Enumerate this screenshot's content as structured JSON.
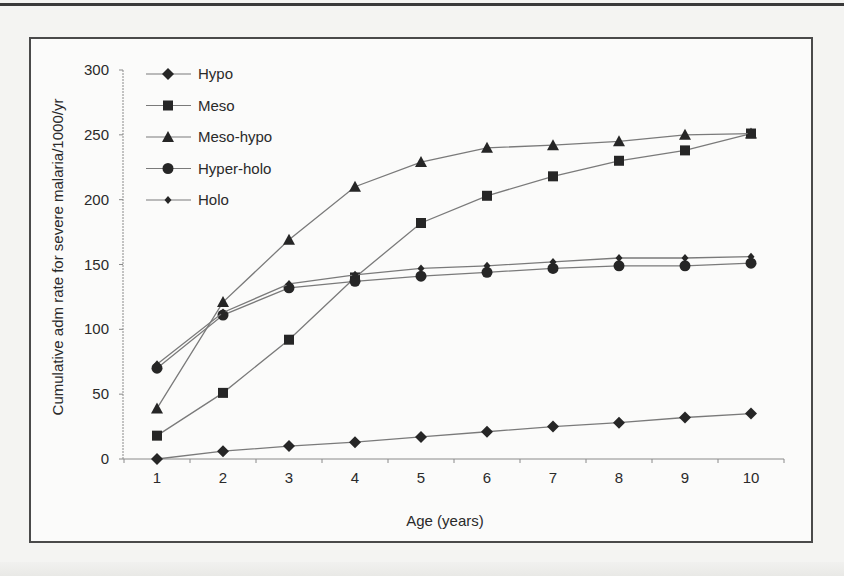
{
  "chart_data": {
    "type": "line",
    "title": "",
    "xlabel": "Age (years)",
    "ylabel": "Cumulative adm rate for severe malaria/1000/yr",
    "x": [
      1,
      2,
      3,
      4,
      5,
      6,
      7,
      8,
      9,
      10
    ],
    "xticks": [
      "1",
      "2",
      "3",
      "4",
      "5",
      "6",
      "7",
      "8",
      "9",
      "10"
    ],
    "yticks": [
      "0",
      "50",
      "100",
      "150",
      "200",
      "250",
      "300"
    ],
    "ylim": [
      0,
      300
    ],
    "xlim": [
      0.5,
      10.5
    ],
    "grid": false,
    "legend_position": "upper-left-inside",
    "series": [
      {
        "name": "Hypo",
        "marker": "diamond",
        "values": [
          0,
          6,
          10,
          13,
          17,
          21,
          25,
          28,
          32,
          35
        ]
      },
      {
        "name": "Meso",
        "marker": "square",
        "values": [
          18,
          51,
          92,
          140,
          182,
          203,
          218,
          230,
          238,
          251
        ]
      },
      {
        "name": "Meso-hypo",
        "marker": "triangle",
        "values": [
          39,
          121,
          169,
          210,
          229,
          240,
          242,
          245,
          250,
          251
        ]
      },
      {
        "name": "Hyper-holo",
        "marker": "circle",
        "values": [
          70,
          111,
          132,
          137,
          141,
          144,
          147,
          149,
          149,
          151
        ]
      },
      {
        "name": "Holo",
        "marker": "small-diamond",
        "values": [
          73,
          113,
          135,
          142,
          147,
          149,
          152,
          155,
          155,
          156
        ]
      }
    ]
  },
  "legend": {
    "items": [
      {
        "label": "Hypo",
        "marker": "diamond"
      },
      {
        "label": "Meso",
        "marker": "square"
      },
      {
        "label": "Meso-hypo",
        "marker": "triangle"
      },
      {
        "label": "Hyper-holo",
        "marker": "circle"
      },
      {
        "label": "Holo",
        "marker": "small-diamond"
      }
    ]
  },
  "colors": {
    "line": "#7a7a7a",
    "marker": "#262626",
    "axis": "#8a8a8a",
    "text": "#2a2a2a",
    "frame": "#4a4a4a"
  }
}
